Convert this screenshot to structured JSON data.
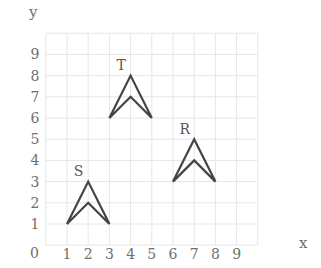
{
  "diagram": {
    "axes": {
      "x_label": "x",
      "y_label": "y",
      "origin_label": "0",
      "x_ticks": [
        "1",
        "2",
        "3",
        "4",
        "5",
        "6",
        "7",
        "8",
        "9"
      ],
      "y_ticks": [
        "1",
        "2",
        "3",
        "4",
        "5",
        "6",
        "7",
        "8",
        "9"
      ]
    },
    "grid": {
      "x_min": 0,
      "x_max": 10,
      "y_min": 0,
      "y_max": 10,
      "color": "#e6e6e6"
    },
    "shape_color": "#444444",
    "shapes": [
      {
        "name": "S",
        "label": "S",
        "points": [
          [
            1,
            1
          ],
          [
            2,
            3
          ],
          [
            3,
            1
          ],
          [
            2,
            2
          ]
        ],
        "label_pos": [
          1.55,
          3.25
        ]
      },
      {
        "name": "T",
        "label": "T",
        "points": [
          [
            3,
            6
          ],
          [
            4,
            8
          ],
          [
            5,
            6
          ],
          [
            4,
            7
          ]
        ],
        "label_pos": [
          3.55,
          8.25
        ]
      },
      {
        "name": "R",
        "label": "R",
        "points": [
          [
            6,
            3
          ],
          [
            7,
            5
          ],
          [
            8,
            3
          ],
          [
            7,
            4
          ]
        ],
        "label_pos": [
          6.55,
          5.25
        ]
      }
    ]
  }
}
